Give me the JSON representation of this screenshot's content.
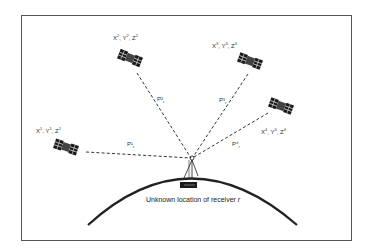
{
  "diagram": {
    "caption": "Unknown location of receiver",
    "caption_var": "r",
    "colors": {
      "line": "#333333",
      "frame": "#555555",
      "satellite": "#1a1a1a",
      "background": "#ffffff"
    },
    "receiver": {
      "x": 191,
      "y": 158,
      "label": "Unknown location of receiver r"
    },
    "earth_arc": {
      "start": [
        88,
        225
      ],
      "peak": [
        190,
        178
      ],
      "end": [
        297,
        225
      ]
    },
    "satellites": [
      {
        "id": 1,
        "coords_label": [
          "X",
          "1",
          "Y",
          "1",
          "Z",
          "1"
        ],
        "label_text": "X¹, Y¹, Z¹",
        "x": 58,
        "y": 146,
        "label_x": 36,
        "label_y": 127,
        "range_label": "P¹",
        "range_sub": "r",
        "range_x": 128,
        "range_y": 142
      },
      {
        "id": 2,
        "coords_label": [
          "X",
          "2",
          "Y",
          "2",
          "Z",
          "2"
        ],
        "label_text": "X², Y², Z²",
        "x": 126,
        "y": 60,
        "label_x": 113,
        "label_y": 34,
        "range_label": "P²",
        "range_sub": "r",
        "range_x": 158,
        "range_y": 97
      },
      {
        "id": 3,
        "coords_label": [
          "X",
          "3",
          "Y",
          "3",
          "Z",
          "3"
        ],
        "label_text": "X³, Y³, Z³",
        "x": 248,
        "y": 62,
        "label_x": 213,
        "label_y": 42,
        "range_label": "P³",
        "range_sub": "r",
        "range_x": 220,
        "range_y": 98
      },
      {
        "id": 4,
        "coords_label": [
          "X",
          "4",
          "Y",
          "4",
          "Z",
          "4"
        ],
        "label_text": "X⁴, Y⁴, Z⁴",
        "x": 280,
        "y": 106,
        "label_x": 261,
        "label_y": 128,
        "range_label": "P⁴",
        "range_sub": "r",
        "range_x": 232,
        "range_y": 142
      }
    ]
  }
}
